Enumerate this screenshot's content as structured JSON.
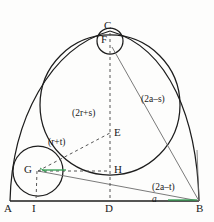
{
  "figure": {
    "background_color": "#fdfdfc",
    "stroke_color": "#1d1d1d",
    "dash_color": "#555555",
    "accent_color": "#2f9e4f",
    "thin_line_color": "#6b6b6b"
  },
  "points": {
    "A": {
      "label": "A",
      "x": 10,
      "y": 201
    },
    "B": {
      "label": "B",
      "x": 199,
      "y": 201
    },
    "C": {
      "label": "C",
      "x": 110,
      "y": 31
    },
    "D": {
      "label": "D",
      "x": 110,
      "y": 201
    },
    "E": {
      "label": "E",
      "x": 110,
      "y": 133
    },
    "F": {
      "label": "F",
      "x": 110,
      "y": 41
    },
    "G": {
      "label": "G",
      "x": 38,
      "y": 171
    },
    "H": {
      "label": "H",
      "x": 110,
      "y": 171
    },
    "I": {
      "label": "I",
      "x": 36,
      "y": 201
    }
  },
  "circles": {
    "incircle_large": {
      "name": "large-inscribed-circle",
      "cx": 110,
      "cy": 105,
      "r": 70
    },
    "circle_F": {
      "name": "small-circle-top",
      "cx": 110,
      "cy": 41,
      "r": 13
    },
    "circle_G": {
      "name": "small-circle-bottom-left",
      "cx": 38,
      "cy": 171,
      "r": 25
    }
  },
  "labels": {
    "seg_2r_plus_s": "(2r+s)",
    "seg_r_plus_t": "(r+t)",
    "seg_2a_minus_s": "(2a–s)",
    "seg_2a_minus_t": "(2a–t)",
    "seg_a": "a"
  }
}
